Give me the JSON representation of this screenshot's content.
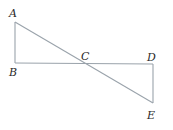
{
  "diagram": {
    "type": "geometry",
    "points": {
      "A": {
        "label": "A",
        "x": 15,
        "y": 22,
        "lx": 9,
        "ly": 17
      },
      "B": {
        "label": "B",
        "x": 15,
        "y": 63,
        "lx": 9,
        "ly": 76
      },
      "C": {
        "label": "C",
        "x": 84,
        "y": 63,
        "lx": 81,
        "ly": 60
      },
      "D": {
        "label": "D",
        "x": 153,
        "y": 64,
        "lx": 147,
        "ly": 61
      },
      "E": {
        "label": "E",
        "x": 153,
        "y": 103,
        "lx": 147,
        "ly": 119
      }
    },
    "segments": [
      {
        "from": "A",
        "to": "B"
      },
      {
        "from": "B",
        "to": "D"
      },
      {
        "from": "D",
        "to": "E"
      },
      {
        "from": "A",
        "to": "E",
        "through": "C"
      }
    ],
    "line_color": "#9aa3ab"
  }
}
